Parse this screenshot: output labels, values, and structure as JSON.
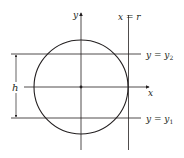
{
  "diagram": {
    "colors": {
      "stroke": "#231f20",
      "background": "#ffffff"
    },
    "axes": {
      "x_label": "x",
      "y_label": "y"
    },
    "lines": {
      "vertical": {
        "lhs": "x",
        "eq": " = ",
        "rhs": "r"
      },
      "upper": {
        "lhs": "y",
        "eq": " = ",
        "rhs": "y",
        "sub": "2"
      },
      "lower": {
        "lhs": "y",
        "eq": " = ",
        "rhs": "y",
        "sub": "1"
      }
    },
    "dimension": {
      "label": "h"
    }
  }
}
